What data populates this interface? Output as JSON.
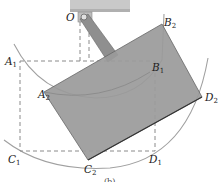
{
  "figure": {
    "caption": "(b)",
    "colors": {
      "background": "#ffffff",
      "plate_fill": "#9a9a9a",
      "plate_edge": "#555555",
      "dashed": "#8a8a8a",
      "arc": "#9a9a9a",
      "support": "#c8c8c8",
      "link": "#8c8c8c"
    },
    "points": {
      "O": {
        "label": "O",
        "x": 84,
        "y": 17
      },
      "A1": {
        "letter": "A",
        "sub": "1",
        "x": 20,
        "y": 61
      },
      "B1": {
        "letter": "B",
        "sub": "1",
        "x": 155,
        "y": 61
      },
      "C1": {
        "letter": "C",
        "sub": "1",
        "x": 20,
        "y": 151
      },
      "D1": {
        "letter": "D",
        "sub": "1",
        "x": 155,
        "y": 151
      },
      "A2": {
        "letter": "A",
        "sub": "2",
        "x": 44,
        "y": 92
      },
      "B2": {
        "letter": "B",
        "sub": "2",
        "x": 162,
        "y": 24
      },
      "C2": {
        "letter": "C",
        "sub": "2",
        "x": 90,
        "y": 158
      },
      "D2": {
        "letter": "D",
        "sub": "2",
        "x": 202,
        "y": 97
      }
    }
  }
}
